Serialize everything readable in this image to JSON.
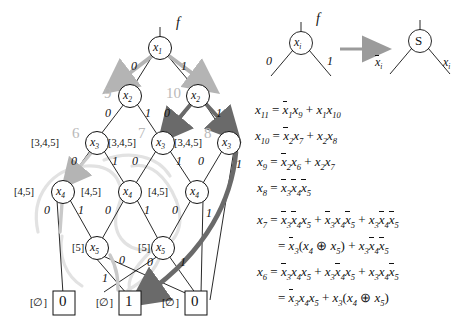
{
  "figure": {
    "accent_gray": "#a8a8a8",
    "accent_dark": "#6f6f6f",
    "ink": "#111111"
  },
  "bdd": {
    "function_label": "f",
    "levels": [
      {
        "variable": "x",
        "subscript": "1",
        "nodes": [
          {
            "id": "n1",
            "cx": 160,
            "cy": 48,
            "index_label": "",
            "set_label": "",
            "low_label": "0",
            "high_label": "1"
          }
        ]
      },
      {
        "variable": "x",
        "subscript": "2",
        "nodes": [
          {
            "id": "n2a",
            "cx": 130,
            "cy": 96,
            "index_label": "9",
            "set_label": "",
            "low_label": "0",
            "high_label": "1"
          },
          {
            "id": "n2b",
            "cx": 198,
            "cy": 96,
            "index_label": "10",
            "set_label": "",
            "low_label": "0",
            "high_label": "1"
          }
        ]
      },
      {
        "variable": "x",
        "subscript": "3",
        "nodes": [
          {
            "id": "n3a",
            "cx": 97,
            "cy": 143,
            "index_label": "6",
            "set_label": "[3,4,5]",
            "low_label": "0",
            "high_label": "1"
          },
          {
            "id": "n3b",
            "cx": 163,
            "cy": 143,
            "index_label": "7",
            "set_label": "[3,4,5]",
            "low_label": "0",
            "high_label": "1"
          },
          {
            "id": "n3c",
            "cx": 229,
            "cy": 143,
            "index_label": "8",
            "set_label": "[3,4,5]",
            "low_label": "0",
            "high_label": "1"
          }
        ]
      },
      {
        "variable": "x",
        "subscript": "4",
        "nodes": [
          {
            "id": "n4a",
            "cx": 63,
            "cy": 192,
            "index_label": "",
            "set_label": "[4,5]",
            "low_label": "0",
            "high_label": "1"
          },
          {
            "id": "n4b",
            "cx": 130,
            "cy": 192,
            "index_label": "",
            "set_label": "[4,5]",
            "low_label": "0",
            "high_label": "1"
          },
          {
            "id": "n4c",
            "cx": 197,
            "cy": 192,
            "index_label": "",
            "set_label": "[4,5]",
            "low_label": "0",
            "high_label": "1"
          }
        ]
      },
      {
        "variable": "x",
        "subscript": "5",
        "nodes": [
          {
            "id": "n5a",
            "cx": 97,
            "cy": 248,
            "index_label": "",
            "set_label": "[5]",
            "low_label": "0",
            "high_label": "1"
          },
          {
            "id": "n5b",
            "cx": 163,
            "cy": 248,
            "index_label": "",
            "set_label": "[5]",
            "low_label": "0",
            "high_label": "1"
          }
        ]
      }
    ],
    "terminals": [
      {
        "id": "t0a",
        "cx": 64,
        "cy": 303,
        "value": "0",
        "set_label": "[∅]"
      },
      {
        "id": "t1",
        "cx": 130,
        "cy": 303,
        "value": "1",
        "set_label": "[∅]"
      },
      {
        "id": "t0b",
        "cx": 196,
        "cy": 303,
        "value": "0",
        "set_label": "[∅]"
      }
    ]
  },
  "legend": {
    "source_node": {
      "variable": "x",
      "subscript": "i",
      "function_label": "f",
      "low_label": "0",
      "high_label": "1"
    },
    "target_node": {
      "glyph": "S",
      "left_label": "x",
      "left_subscript": "i",
      "left_complemented": true,
      "right_label": "x",
      "right_subscript": "i",
      "right_complemented": false
    },
    "arrow": "right-arrow"
  },
  "equations": [
    {
      "id": "eq-x11",
      "lhs": "x",
      "lhs_sub": "11",
      "rhs_html": "x̉1 x9 + x1 x10",
      "text": "x11 = x̉1x9 + x1x10"
    },
    {
      "id": "eq-x10",
      "lhs": "x",
      "lhs_sub": "10",
      "text": "x10 = x̉2x7 + x2x8"
    },
    {
      "id": "eq-x9",
      "lhs": "x",
      "lhs_sub": "9",
      "text": "x9 = x̉2x6 + x2x7"
    },
    {
      "id": "eq-x8",
      "lhs": "x",
      "lhs_sub": "8",
      "text": "x8 = x̉3x̉4x̉5"
    },
    {
      "id": "eq-x7",
      "lhs": "x",
      "lhs_sub": "7",
      "text": "x7 = x̉3x̉4x5 + x̉3x4x̉5 + x3x̉4x̉5"
    },
    {
      "id": "eq-x7b",
      "lhs": "",
      "lhs_sub": "",
      "text": "= x̉3(x4 ⊕ x5) + x3x̉4x̉5"
    },
    {
      "id": "eq-x6",
      "lhs": "x",
      "lhs_sub": "6",
      "text": "x6 = x̉3x4x5 + x3x̉4x5 + x3x4x̉5"
    },
    {
      "id": "eq-x6b",
      "lhs": "",
      "lhs_sub": "",
      "text": "= x̉3x4x5 + x3(x4 ⊕ x5)"
    }
  ],
  "symbols": {
    "plus": "+",
    "xor": "⊕",
    "equals": "=",
    "lparen": "(",
    "rparen": ")",
    "emptyset": "∅"
  }
}
